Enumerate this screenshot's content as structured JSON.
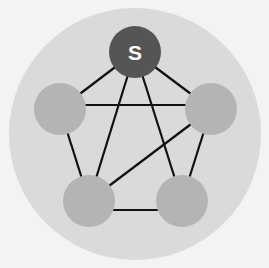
{
  "diagram": {
    "type": "network-graph",
    "colors": {
      "background": "#f3f3f3",
      "outer_circle": "#dadada",
      "node": "#b4b4b4",
      "source_node": "#555555",
      "edge": "#111111",
      "label": "#ffffff"
    },
    "nodes": [
      {
        "id": "s",
        "label": "S",
        "role": "source"
      },
      {
        "id": "left",
        "label": "",
        "role": "peer"
      },
      {
        "id": "right",
        "label": "",
        "role": "peer"
      },
      {
        "id": "bottom-left",
        "label": "",
        "role": "peer"
      },
      {
        "id": "bottom-right",
        "label": "",
        "role": "peer"
      }
    ],
    "edges": [
      {
        "from": "s",
        "to": "left"
      },
      {
        "from": "s",
        "to": "right"
      },
      {
        "from": "s",
        "to": "bottom-left"
      },
      {
        "from": "s",
        "to": "bottom-right"
      },
      {
        "from": "left",
        "to": "right"
      },
      {
        "from": "left",
        "to": "bottom-left"
      },
      {
        "from": "right",
        "to": "bottom-left"
      },
      {
        "from": "right",
        "to": "bottom-right"
      },
      {
        "from": "bottom-left",
        "to": "bottom-right"
      }
    ]
  }
}
